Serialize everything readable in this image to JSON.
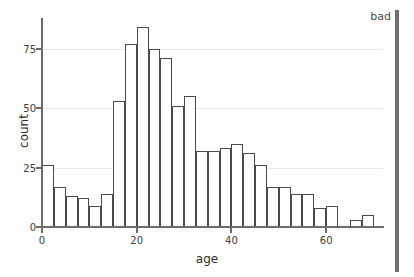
{
  "chart_data": {
    "type": "bar",
    "title": "",
    "subtitle": "",
    "xlabel": "age",
    "ylabel": "count",
    "xlim": [
      0,
      72
    ],
    "ylim": [
      0,
      87
    ],
    "grid": true,
    "legend": null,
    "bin_width": 2.5,
    "x_ticks": [
      {
        "value": 0,
        "label": "0"
      },
      {
        "value": 20,
        "label": "20"
      },
      {
        "value": 40,
        "label": "40"
      },
      {
        "value": 60,
        "label": "60"
      }
    ],
    "y_ticks": [
      {
        "value": 0,
        "label": "0"
      },
      {
        "value": 25,
        "label": "25"
      },
      {
        "value": 50,
        "label": "50"
      },
      {
        "value": 75,
        "label": "75"
      }
    ],
    "bins": [
      {
        "x0": 0.0,
        "x1": 2.5,
        "count": 26
      },
      {
        "x0": 2.5,
        "x1": 5.0,
        "count": 17
      },
      {
        "x0": 5.0,
        "x1": 7.5,
        "count": 13
      },
      {
        "x0": 7.5,
        "x1": 10.0,
        "count": 12
      },
      {
        "x0": 10.0,
        "x1": 12.5,
        "count": 9
      },
      {
        "x0": 12.5,
        "x1": 15.0,
        "count": 14
      },
      {
        "x0": 15.0,
        "x1": 17.5,
        "count": 53
      },
      {
        "x0": 17.5,
        "x1": 20.0,
        "count": 77
      },
      {
        "x0": 20.0,
        "x1": 22.5,
        "count": 84
      },
      {
        "x0": 22.5,
        "x1": 25.0,
        "count": 75
      },
      {
        "x0": 25.0,
        "x1": 27.5,
        "count": 71
      },
      {
        "x0": 27.5,
        "x1": 30.0,
        "count": 51
      },
      {
        "x0": 30.0,
        "x1": 32.5,
        "count": 55
      },
      {
        "x0": 32.5,
        "x1": 35.0,
        "count": 32
      },
      {
        "x0": 35.0,
        "x1": 37.5,
        "count": 32
      },
      {
        "x0": 37.5,
        "x1": 40.0,
        "count": 33
      },
      {
        "x0": 40.0,
        "x1": 42.5,
        "count": 35
      },
      {
        "x0": 42.5,
        "x1": 45.0,
        "count": 31
      },
      {
        "x0": 45.0,
        "x1": 47.5,
        "count": 26
      },
      {
        "x0": 47.5,
        "x1": 50.0,
        "count": 17
      },
      {
        "x0": 50.0,
        "x1": 52.5,
        "count": 17
      },
      {
        "x0": 52.5,
        "x1": 55.0,
        "count": 14
      },
      {
        "x0": 55.0,
        "x1": 57.5,
        "count": 14
      },
      {
        "x0": 57.5,
        "x1": 60.0,
        "count": 8
      },
      {
        "x0": 60.0,
        "x1": 62.5,
        "count": 9
      },
      {
        "x0": 62.5,
        "x1": 65.0,
        "count": 0
      },
      {
        "x0": 65.0,
        "x1": 67.5,
        "count": 3
      },
      {
        "x0": 67.5,
        "x1": 70.0,
        "count": 5
      }
    ]
  },
  "annotation": {
    "label": "bad",
    "marker_color": "#6f6f6f"
  },
  "colors": {
    "bar_edge": "#4a4a4a",
    "bar_fill": "#ffffff",
    "axis": "#6b6b6b",
    "grid": "#e9e9e9",
    "text": "#2d2d2d",
    "background": "#ffffff"
  }
}
